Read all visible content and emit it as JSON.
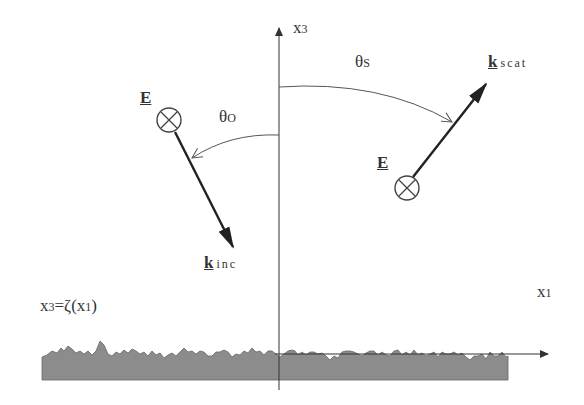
{
  "diagram": {
    "axes": {
      "vertical_label": "x",
      "vertical_sub": "3",
      "horizontal_label": "x",
      "horizontal_sub": "1"
    },
    "angles": {
      "incident": {
        "symbol": "θ",
        "sub": "O"
      },
      "scattered": {
        "symbol": "θ",
        "sub": "S"
      }
    },
    "incident": {
      "field_label": "E",
      "wave_vector": "k",
      "wave_vector_sub": "inc"
    },
    "scattered": {
      "field_label": "E",
      "wave_vector": "k",
      "wave_vector_sub": "scat"
    },
    "surface": {
      "equation_lhs": "x",
      "equation_lhs_sub": "3",
      "equation_rhs": "=ζ(x",
      "equation_rhs_sub": "1",
      "equation_close": ")"
    },
    "colors": {
      "line": "#333333",
      "surface_fill": "#8c8c8c",
      "arc": "#555555"
    }
  }
}
